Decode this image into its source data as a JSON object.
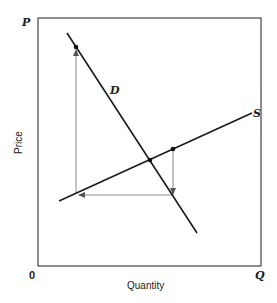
{
  "diagram": {
    "axes": {
      "y_axis_symbol": "P",
      "x_axis_symbol": "Q",
      "origin_label": "0",
      "y_label": "Price",
      "x_label": "Quantity"
    },
    "curves": {
      "demand_label": "D",
      "supply_label": "S"
    },
    "colors": {
      "curve": "#1a1a1a",
      "arrow": "#8a8a8a",
      "axis": "#444444"
    }
  }
}
